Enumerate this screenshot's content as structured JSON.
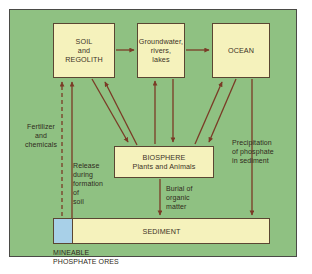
{
  "figure": {
    "colors": {
      "background_field": "#8fc182",
      "box_fill": "#f5f2bc",
      "box_border": "#5a4632",
      "arrow": "#7a3b26",
      "mineable_ore_fill": "#a8d0e8",
      "frame": "#4a4a46",
      "page": "#ffffff"
    }
  },
  "nodes": {
    "soil": {
      "label": "SOIL\nand\nREGOLITH"
    },
    "groundwater": {
      "label": "Groundwater,\nrivers,\nlakes"
    },
    "ocean": {
      "label": "OCEAN"
    },
    "biosphere": {
      "label": "BIOSPHERE\nPlants and Animals"
    },
    "sediment": {
      "label": "SEDIMENT"
    },
    "mineable": {
      "label": "MINEABLE\nPHOSPHATE ORES"
    }
  },
  "labels": {
    "fertilizer": "Fertilizer\nand\nchemicals",
    "release": "Release\nduring\nformation\nof\nsoil",
    "burial": "Burial of\norganic\nmatter",
    "precipitation": "Precipitation\nof phosphate\nin sediment"
  },
  "flows": [
    {
      "name": "soil-to-groundwater",
      "from": "soil",
      "to": "groundwater",
      "style": "solid"
    },
    {
      "name": "groundwater-to-ocean",
      "from": "groundwater",
      "to": "ocean",
      "style": "solid"
    },
    {
      "name": "soil-to-biosphere",
      "from": "soil",
      "to": "biosphere",
      "style": "solid"
    },
    {
      "name": "biosphere-to-soil",
      "from": "biosphere",
      "to": "soil",
      "style": "solid"
    },
    {
      "name": "biosphere-to-groundwater",
      "from": "biosphere",
      "to": "groundwater",
      "style": "solid"
    },
    {
      "name": "groundwater-to-biosphere",
      "from": "groundwater",
      "to": "biosphere",
      "style": "solid"
    },
    {
      "name": "biosphere-to-ocean",
      "from": "biosphere",
      "to": "ocean",
      "style": "solid"
    },
    {
      "name": "ocean-to-biosphere",
      "from": "ocean",
      "to": "biosphere",
      "style": "solid"
    },
    {
      "name": "biosphere-to-sediment-burial",
      "from": "biosphere",
      "to": "sediment",
      "style": "solid",
      "label": "Burial of organic matter"
    },
    {
      "name": "ocean-to-sediment-precipitation",
      "from": "ocean",
      "to": "sediment",
      "style": "solid",
      "label": "Precipitation of phosphate in sediment"
    },
    {
      "name": "sediment-to-soil-release",
      "from": "sediment",
      "to": "soil",
      "style": "solid",
      "label": "Release during formation of soil"
    },
    {
      "name": "mineable-to-soil-fertilizer",
      "from": "mineable",
      "to": "soil",
      "style": "dashed",
      "label": "Fertilizer and chemicals"
    }
  ]
}
